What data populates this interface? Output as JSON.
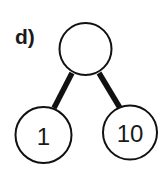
{
  "panel_label": "d)",
  "tree": {
    "root": {
      "value": "",
      "cx": 85.5,
      "cy": 49,
      "r": 26
    },
    "left": {
      "value": "1",
      "cx": 43.5,
      "cy": 135,
      "r": 28
    },
    "right": {
      "value": "10",
      "cx": 130,
      "cy": 132.5,
      "r": 27
    }
  },
  "edges": [
    {
      "from": "root",
      "to": "left",
      "x1": 72,
      "y1": 73,
      "x2": 54,
      "y2": 108
    },
    {
      "from": "root",
      "to": "right",
      "x1": 99,
      "y1": 73,
      "x2": 120,
      "y2": 108
    }
  ],
  "colors": {
    "stroke": "#111111",
    "fill": "#ffffff"
  }
}
